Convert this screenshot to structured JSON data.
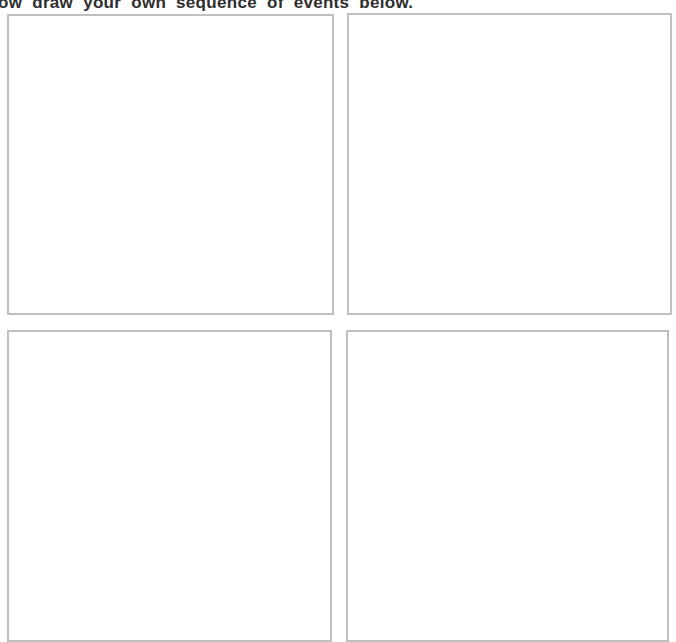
{
  "worksheet": {
    "instruction": "ow draw your own sequence of events below.",
    "grid": {
      "rows": 2,
      "cols": 2
    },
    "panels": [
      {
        "id": "top-left",
        "content": ""
      },
      {
        "id": "top-right",
        "content": ""
      },
      {
        "id": "bottom-left",
        "content": ""
      },
      {
        "id": "bottom-right",
        "content": ""
      }
    ]
  },
  "colors": {
    "background": "#ffffff",
    "panel-border": "#bfbfbf",
    "text": "#2e2e2e"
  }
}
